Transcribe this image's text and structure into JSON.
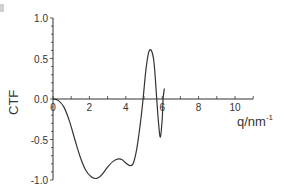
{
  "chart_data": {
    "type": "line",
    "title": "",
    "xlabel": "q/nm",
    "xlabel_superscript": "-1",
    "ylabel": "CTF",
    "xlim": [
      0,
      11
    ],
    "ylim": [
      -1.0,
      1.0
    ],
    "x_ticks": [
      "0",
      "2",
      "4",
      "6",
      "8",
      "10"
    ],
    "y_ticks": [
      "1.0",
      "0.5",
      "0.0",
      "-0.5",
      "-1.0"
    ],
    "grid": false,
    "legend": null,
    "series": [
      {
        "name": "CTF",
        "color": "#333333",
        "x": [
          0,
          0.3,
          0.6,
          0.9,
          1.2,
          1.5,
          1.8,
          2.1,
          2.4,
          2.7,
          3.0,
          3.3,
          3.6,
          3.8,
          4.0,
          4.2,
          4.4,
          4.6,
          4.8,
          4.95,
          5.1,
          5.25,
          5.4,
          5.55,
          5.7,
          5.8,
          5.9,
          6.0,
          6.05,
          6.1,
          6.12
        ],
        "values": [
          0,
          -0.02,
          -0.1,
          -0.27,
          -0.5,
          -0.72,
          -0.88,
          -0.96,
          -0.98,
          -0.93,
          -0.84,
          -0.77,
          -0.74,
          -0.75,
          -0.79,
          -0.82,
          -0.8,
          -0.62,
          -0.3,
          0.0,
          0.35,
          0.57,
          0.6,
          0.45,
          0.0,
          -0.3,
          -0.47,
          -0.25,
          0.0,
          0.1,
          0.13
        ]
      }
    ]
  }
}
